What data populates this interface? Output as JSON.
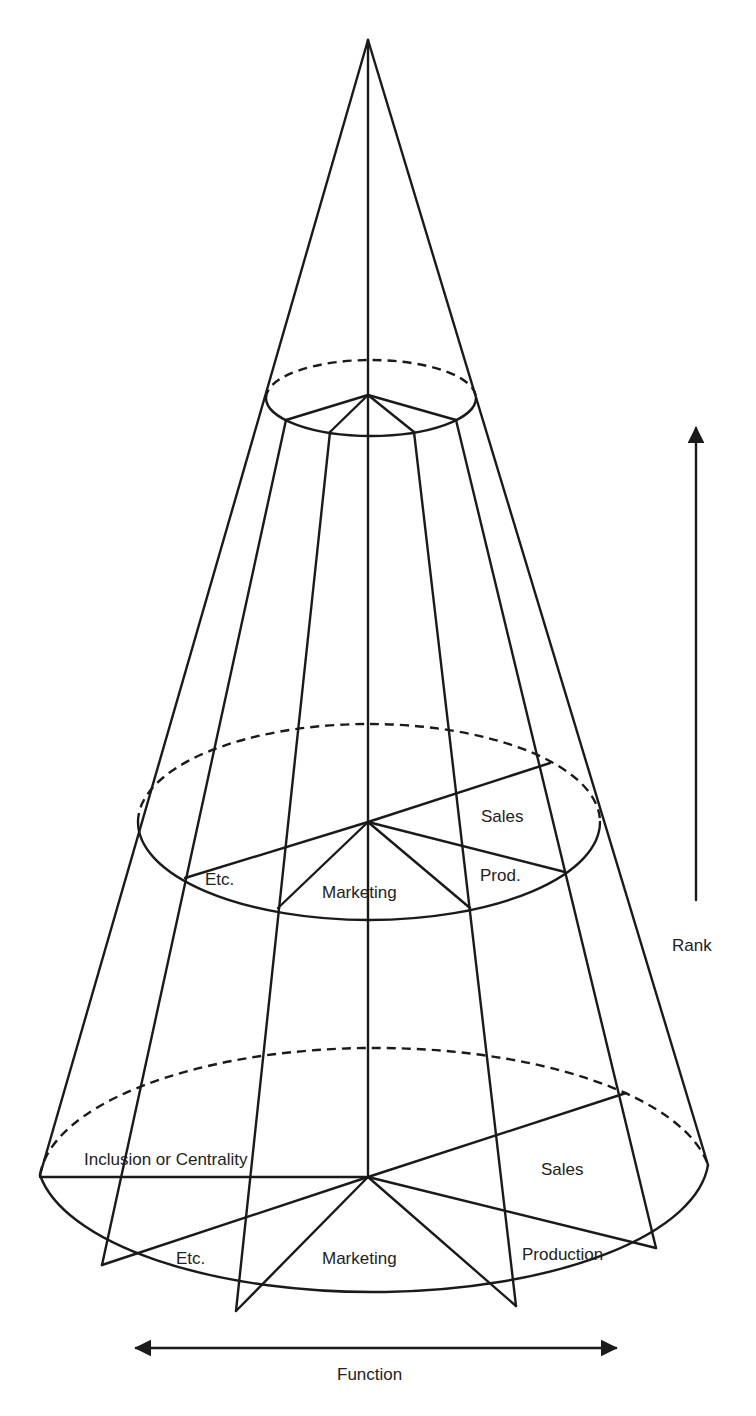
{
  "diagram": {
    "type": "cone-model",
    "line_color": "#1a1a1a",
    "background": "#ffffff",
    "middle_level": {
      "labels": {
        "etc": "Etc.",
        "marketing": "Marketing",
        "production": "Prod.",
        "sales": "Sales"
      }
    },
    "base_level": {
      "labels": {
        "inclusion": "Inclusion or Centrality",
        "etc": "Etc.",
        "marketing": "Marketing",
        "production": "Production",
        "sales": "Sales"
      }
    },
    "axes": {
      "vertical": {
        "label": "Rank",
        "direction": "up"
      },
      "horizontal": {
        "label": "Function",
        "direction": "both"
      }
    }
  }
}
